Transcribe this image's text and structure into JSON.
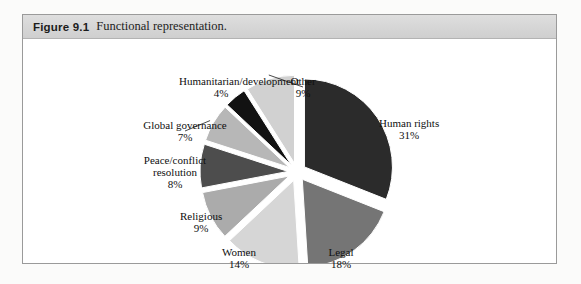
{
  "figure": {
    "number": "Figure 9.1",
    "caption": "Functional representation."
  },
  "chart_data": {
    "type": "pie",
    "title": "Functional representation.",
    "exploded": true,
    "legend": "none",
    "center": [
      274,
      133
    ],
    "radius": 88,
    "start_angle": -90,
    "categories": [
      "Human rights",
      "Legal",
      "Women",
      "Religious",
      "Peace/conflict resolution",
      "Global governance",
      "Humanitarian/development",
      "Other"
    ],
    "values": [
      31,
      18,
      14,
      9,
      8,
      7,
      4,
      9
    ],
    "slices": [
      {
        "label": "Human rights",
        "pct": 31,
        "pct_text": "31%",
        "color": "#2b2b2b",
        "label_x": 356,
        "label_y": 90,
        "align": "left",
        "explode": 9
      },
      {
        "label": "Legal",
        "pct": 18,
        "pct_text": "18%",
        "color": "#757575",
        "label_x": 318,
        "label_y": 219,
        "align": "center",
        "explode": 9
      },
      {
        "label": "Women",
        "pct": 14,
        "pct_text": "14%",
        "color": "#d6d6d6",
        "label_x": 216,
        "label_y": 219,
        "align": "center",
        "explode": 9
      },
      {
        "label": "Religious",
        "pct": 9,
        "pct_text": "9%",
        "color": "#ababab",
        "label_x": 178,
        "label_y": 183,
        "align": "center",
        "explode": 9
      },
      {
        "label": "Peace/conflict resolution",
        "pct": 8,
        "pct_text": "8%",
        "color": "#4d4d4d",
        "label_x": 152,
        "label_y": 133,
        "align": "center",
        "explode": 9
      },
      {
        "label": "Global governance",
        "pct": 7,
        "pct_text": "7%",
        "color": "#b7b7b7",
        "label_x": 162,
        "label_y": 92,
        "align": "center",
        "explode": 9
      },
      {
        "label": "Humanitarian/development",
        "pct": 4,
        "pct_text": "4%",
        "color": "#121212",
        "label_x": 198,
        "label_y": 48,
        "align": "center",
        "explode": 9
      },
      {
        "label": "Other",
        "pct": 9,
        "pct_text": "9%",
        "color": "#d1d1d1",
        "label_x": 280,
        "label_y": 48,
        "align": "center",
        "explode": 9
      }
    ],
    "xlabel": "",
    "ylabel": ""
  }
}
